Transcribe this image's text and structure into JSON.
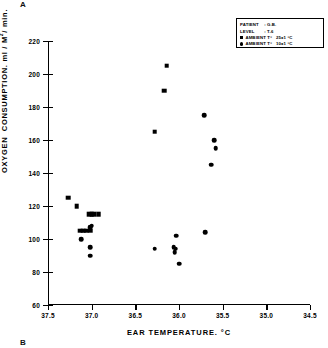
{
  "figure": {
    "panel_a_label": "A",
    "panel_b_label": "B"
  },
  "legend": {
    "patient_key": "PATIENT",
    "patient_value": "G.B.",
    "level_key": "LEVEL",
    "level_value": "T-6",
    "separator": ":",
    "entries": [
      {
        "marker": "square",
        "text": "AMBIENT T°",
        "value": "25±1 °C"
      },
      {
        "marker": "circle",
        "text": "AMBIENT T°",
        "value": "10±1 °C"
      }
    ]
  },
  "chart_data": {
    "type": "scatter",
    "title": "",
    "xlabel": "EAR   TEMPERATURE. °C",
    "ylabel": "OXYGEN  CONSUMPTION. ml / M² / min.",
    "xlim": [
      37.5,
      34.5
    ],
    "ylim": [
      60,
      220
    ],
    "x_reversed": true,
    "xticks": [
      37.5,
      37.0,
      36.5,
      36.0,
      35.5,
      35.0,
      34.5
    ],
    "xticklabels": [
      "37.5",
      "37.0",
      "36.5",
      "36.0",
      "35.5",
      "35.0",
      "34.5"
    ],
    "yticks": [
      60,
      80,
      100,
      120,
      140,
      160,
      180,
      200,
      220
    ],
    "yticklabels": [
      "60",
      "80",
      "100",
      "120",
      "140",
      "160",
      "180",
      "200",
      "220"
    ],
    "grid": false,
    "legend_position": "upper right",
    "series": [
      {
        "name": "AMBIENT T° 25±1 °C",
        "marker": "square",
        "color": "#000000",
        "points": [
          {
            "x": 37.03,
            "y": 115
          },
          {
            "x": 37.0,
            "y": 115
          },
          {
            "x": 36.97,
            "y": 115
          },
          {
            "x": 36.92,
            "y": 115
          },
          {
            "x": 37.13,
            "y": 105
          },
          {
            "x": 37.1,
            "y": 105
          },
          {
            "x": 37.06,
            "y": 105
          },
          {
            "x": 37.02,
            "y": 105
          },
          {
            "x": 37.17,
            "y": 120
          },
          {
            "x": 37.27,
            "y": 125
          },
          {
            "x": 36.14,
            "y": 205
          },
          {
            "x": 36.17,
            "y": 190
          },
          {
            "x": 36.28,
            "y": 165
          }
        ]
      },
      {
        "name": "AMBIENT T° 10±1 °C",
        "marker": "circle",
        "color": "#000000",
        "points": [
          {
            "x": 37.0,
            "y": 108
          },
          {
            "x": 37.02,
            "y": 107
          },
          {
            "x": 37.12,
            "y": 100
          },
          {
            "x": 37.02,
            "y": 95
          },
          {
            "x": 37.02,
            "y": 90
          },
          {
            "x": 36.28,
            "y": 94
          },
          {
            "x": 36.03,
            "y": 102
          },
          {
            "x": 36.06,
            "y": 95
          },
          {
            "x": 36.04,
            "y": 94
          },
          {
            "x": 36.05,
            "y": 92
          },
          {
            "x": 36.0,
            "y": 85
          },
          {
            "x": 35.71,
            "y": 175
          },
          {
            "x": 35.6,
            "y": 160
          },
          {
            "x": 35.58,
            "y": 155
          },
          {
            "x": 35.63,
            "y": 145
          },
          {
            "x": 35.7,
            "y": 104
          }
        ]
      }
    ]
  }
}
